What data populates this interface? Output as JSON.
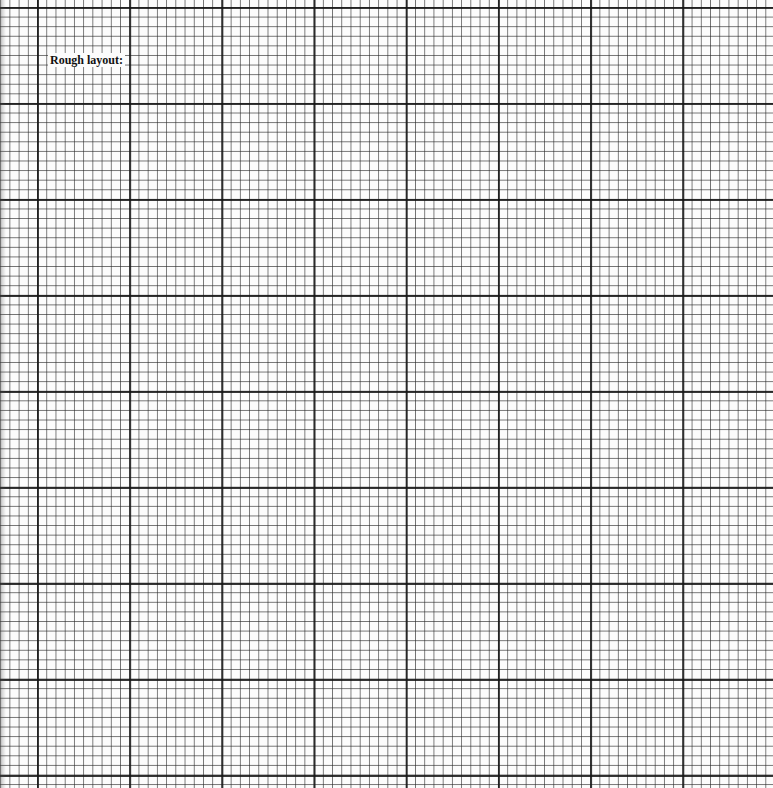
{
  "sheet": {
    "type": "graph-paper",
    "label": "Rough layout:",
    "grid": {
      "minor_spacing_px": 9.2,
      "major_every_cells": 10,
      "line_color": "#1a1a1a",
      "paper_color": "#fcfcfc"
    }
  }
}
